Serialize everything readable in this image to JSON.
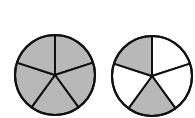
{
  "diagram": {
    "colors": {
      "shaded": "#b8b8b8",
      "unshaded": "#ffffff",
      "stroke": "#111111"
    },
    "circles": [
      {
        "name": "left-circle",
        "cx": 55,
        "cy": 75,
        "r": 40,
        "sectors": 5,
        "shaded_sectors": [
          0,
          1,
          2,
          3,
          4
        ],
        "shaded_count": 5
      },
      {
        "name": "right-circle",
        "cx": 152,
        "cy": 76,
        "r": 40,
        "sectors": 5,
        "shaded_sectors": [
          2,
          4
        ],
        "shaded_count": 2
      }
    ]
  }
}
